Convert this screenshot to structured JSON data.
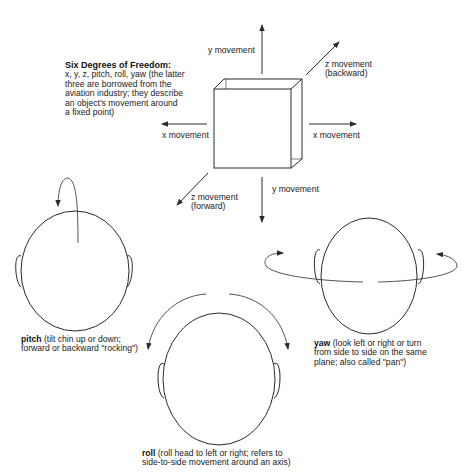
{
  "intro": {
    "title": "Six Degrees of Freedom:",
    "lines": [
      "x, y, z, pitch, roll, yaw (the latter",
      "three are borrowed from the",
      "aviation industry; they describe",
      "an object's movement around",
      "a fixed point)"
    ]
  },
  "axes": {
    "y_up": "y movement",
    "y_down": "y movement",
    "x_left": "x movement",
    "x_right": "x movement",
    "z_backward": [
      "z movement",
      "(backward)"
    ],
    "z_forward": [
      "z movement",
      "(forward)"
    ]
  },
  "heads": {
    "pitch": {
      "term": "pitch",
      "lines": [
        " (tilt chin up or down;",
        "forward or backward \"rocking\")"
      ]
    },
    "yaw": {
      "term": "yaw",
      "lines": [
        " (look left or right or turn",
        "from side to side on the same",
        "plane; also called \"pan\")"
      ]
    },
    "roll": {
      "term": "roll",
      "lines": [
        " (roll head to left or right; refers to",
        "side-to-side movement around an axis)"
      ]
    }
  },
  "colors": {
    "stroke": "#2a2a2a",
    "background": "#ffffff"
  }
}
